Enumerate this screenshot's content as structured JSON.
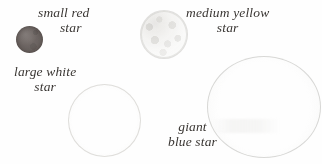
{
  "figure": {
    "background_color": "#fefefe",
    "text_color": "#2b2724"
  },
  "stars": [
    {
      "id": "red",
      "name": "small red star",
      "label_line1": "small red",
      "label_line2": "star",
      "size_class": "small",
      "color_name": "red",
      "render_color": "#655d5a",
      "style": "solid filled disc",
      "diameter_px": 27
    },
    {
      "id": "yellow",
      "name": "medium yellow star",
      "label_line1": "medium yellow",
      "label_line2": "star",
      "size_class": "medium",
      "color_name": "yellow",
      "render_color": "#d6d4ce",
      "style": "mottled grainy disc",
      "diameter_px": 46
    },
    {
      "id": "white",
      "name": "large white star",
      "label_line1": "large white",
      "label_line2": "star",
      "size_class": "large",
      "color_name": "white",
      "render_color": "#cbc9c5",
      "style": "faint thin outline",
      "diameter_px": 71
    },
    {
      "id": "blue",
      "name": "giant blue star",
      "label_line1": "giant",
      "label_line2": "blue star",
      "size_class": "giant",
      "color_name": "blue",
      "render_color": "#c6c5c2",
      "style": "large faint outline",
      "diameter_px": 112
    }
  ]
}
